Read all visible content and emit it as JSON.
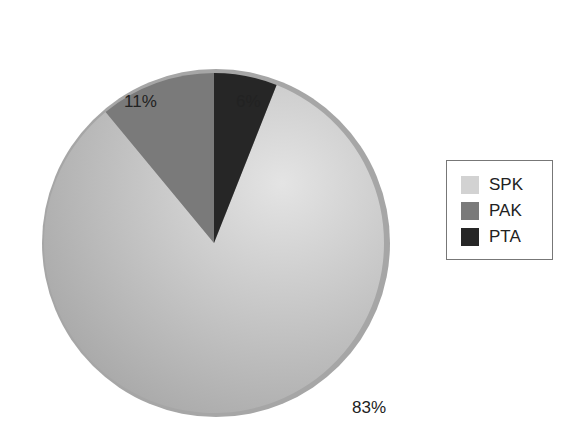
{
  "chart_data": {
    "type": "pie",
    "title": "",
    "categories": [
      "SPK",
      "PAK",
      "PTA"
    ],
    "values": [
      83,
      11,
      6
    ],
    "unit": "%",
    "slice_labels": [
      "83%",
      "11%",
      "6%"
    ],
    "colors": [
      "#c9c9c9",
      "#7a7a7a",
      "#262626"
    ],
    "legend": {
      "position": "right",
      "entries": [
        "SPK",
        "PAK",
        "PTA"
      ]
    },
    "start_angle": "12 o'clock, PTA clockwise; PAK counter-clockwise"
  },
  "labels": {
    "spk": "83%",
    "pak": "11%",
    "pta": "6%"
  },
  "legend": {
    "items": [
      {
        "label": "SPK",
        "color": "#d2d2d2"
      },
      {
        "label": "PAK",
        "color": "#7a7a7a"
      },
      {
        "label": "PTA",
        "color": "#262626"
      }
    ]
  }
}
